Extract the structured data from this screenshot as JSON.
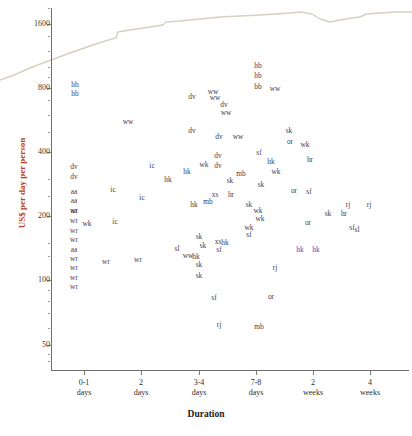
{
  "chart_data": {
    "type": "scatter",
    "title": "",
    "xlabel": "Duration",
    "ylabel": "US$ per day per person",
    "yscale": "log",
    "ylim": [
      38,
      1900
    ],
    "grid": false,
    "legend": "none",
    "ylabel_color": "#b0432a",
    "point_color": "#3c3c52",
    "highlight_color": "#2f4fa8",
    "curve_color": "#d9cfbe",
    "ytick_labels": [
      "1600",
      "800",
      "400",
      "200",
      "100",
      "50"
    ],
    "ytick_values": [
      1600,
      800,
      400,
      200,
      100,
      50
    ],
    "xtick_labels": [
      {
        "line1": "0-1",
        "line2": "days"
      },
      {
        "line1": "2",
        "line2": "days"
      },
      {
        "line1": "3-4",
        "line2": "days"
      },
      {
        "line1": "7-8",
        "line2": "days"
      },
      {
        "line1": "2",
        "line2": "weeks"
      },
      {
        "line1": "4",
        "line2": "weeks"
      }
    ],
    "xtick_positions_px": [
      84,
      141,
      199,
      256,
      313,
      370
    ],
    "points": [
      {
        "label": "hb",
        "x": 75,
        "y": 85,
        "color": "normal"
      },
      {
        "label": "hb",
        "x": 75,
        "y": 94,
        "color": "normal"
      },
      {
        "label": "hb",
        "x": 258,
        "y": 66,
        "color": "normal"
      },
      {
        "label": "hb",
        "x": 258,
        "y": 76,
        "color": "normal"
      },
      {
        "label": "bb",
        "x": 258,
        "y": 87,
        "color": "normal"
      },
      {
        "label": "ww",
        "x": 213,
        "y": 92,
        "color": "normal"
      },
      {
        "label": "ww",
        "x": 275,
        "y": 89,
        "color": "normal"
      },
      {
        "label": "ww",
        "x": 128,
        "y": 122,
        "color": "normal"
      },
      {
        "label": "ww",
        "x": 226,
        "y": 113,
        "color": "normal"
      },
      {
        "label": "ww",
        "x": 238,
        "y": 137,
        "color": "normal"
      },
      {
        "label": "ww",
        "x": 215,
        "y": 98,
        "color": "normal"
      },
      {
        "label": "dv",
        "x": 192,
        "y": 97,
        "color": "normal"
      },
      {
        "label": "dv",
        "x": 224,
        "y": 105,
        "color": "normal"
      },
      {
        "label": "dv",
        "x": 192,
        "y": 131,
        "color": "normal"
      },
      {
        "label": "dv",
        "x": 219,
        "y": 137,
        "color": "normal"
      },
      {
        "label": "dv",
        "x": 74,
        "y": 167,
        "color": "normal"
      },
      {
        "label": "dv",
        "x": 74,
        "y": 177,
        "color": "normal"
      },
      {
        "label": "dv",
        "x": 218,
        "y": 156,
        "color": "normal"
      },
      {
        "label": "dv",
        "x": 218,
        "y": 166,
        "color": "normal"
      },
      {
        "label": "ic",
        "x": 152,
        "y": 166,
        "color": "normal"
      },
      {
        "label": "ic",
        "x": 113,
        "y": 190,
        "color": "normal"
      },
      {
        "label": "ic",
        "x": 142,
        "y": 198,
        "color": "normal"
      },
      {
        "label": "ic",
        "x": 115,
        "y": 222,
        "color": "normal"
      },
      {
        "label": "hk",
        "x": 168,
        "y": 180,
        "color": "normal"
      },
      {
        "label": "hk",
        "x": 187,
        "y": 172,
        "color": "normal"
      },
      {
        "label": "hk",
        "x": 194,
        "y": 205,
        "color": "normal"
      },
      {
        "label": "hk",
        "x": 271,
        "y": 162,
        "color": "normal"
      },
      {
        "label": "hk",
        "x": 196,
        "y": 257,
        "color": "normal"
      },
      {
        "label": "hk",
        "x": 225,
        "y": 243,
        "color": "normal"
      },
      {
        "label": "wk",
        "x": 204,
        "y": 165,
        "color": "normal"
      },
      {
        "label": "wk",
        "x": 276,
        "y": 172,
        "color": "normal"
      },
      {
        "label": "wk",
        "x": 87,
        "y": 224,
        "color": "normal"
      },
      {
        "label": "wk",
        "x": 305,
        "y": 145,
        "color": "normal"
      },
      {
        "label": "wk",
        "x": 258,
        "y": 211,
        "color": "normal"
      },
      {
        "label": "wk",
        "x": 260,
        "y": 219,
        "color": "normal"
      },
      {
        "label": "wk",
        "x": 249,
        "y": 228,
        "color": "normal"
      },
      {
        "label": "xs",
        "x": 215,
        "y": 195,
        "color": "normal"
      },
      {
        "label": "xs",
        "x": 218,
        "y": 242,
        "color": "normal"
      },
      {
        "label": "hr",
        "x": 231,
        "y": 195,
        "color": "normal"
      },
      {
        "label": "hr",
        "x": 310,
        "y": 160,
        "color": "normal"
      },
      {
        "label": "hr",
        "x": 344,
        "y": 214,
        "color": "normal"
      },
      {
        "label": "mb",
        "x": 208,
        "y": 202,
        "color": "normal"
      },
      {
        "label": "mb",
        "x": 241,
        "y": 174,
        "color": "normal"
      },
      {
        "label": "mb",
        "x": 259,
        "y": 327,
        "color": "normal"
      },
      {
        "label": "sf",
        "x": 259,
        "y": 153,
        "color": "normal"
      },
      {
        "label": "sf",
        "x": 309,
        "y": 192,
        "color": "normal"
      },
      {
        "label": "sf",
        "x": 219,
        "y": 250,
        "color": "normal"
      },
      {
        "label": "sf",
        "x": 249,
        "y": 235,
        "color": "normal"
      },
      {
        "label": "sf",
        "x": 214,
        "y": 298,
        "color": "normal"
      },
      {
        "label": "sf",
        "x": 352,
        "y": 228,
        "color": "normal"
      },
      {
        "label": "sk",
        "x": 289,
        "y": 131,
        "color": "normal"
      },
      {
        "label": "sk",
        "x": 261,
        "y": 185,
        "color": "normal"
      },
      {
        "label": "sk",
        "x": 230,
        "y": 181,
        "color": "normal"
      },
      {
        "label": "sk",
        "x": 249,
        "y": 205,
        "color": "normal"
      },
      {
        "label": "sk",
        "x": 328,
        "y": 214,
        "color": "normal"
      },
      {
        "label": "sk",
        "x": 199,
        "y": 237,
        "color": "normal"
      },
      {
        "label": "sk",
        "x": 199,
        "y": 265,
        "color": "normal"
      },
      {
        "label": "sk",
        "x": 199,
        "y": 276,
        "color": "normal"
      },
      {
        "label": "sk",
        "x": 203,
        "y": 246,
        "color": "normal"
      },
      {
        "label": "or",
        "x": 290,
        "y": 142,
        "color": "normal"
      },
      {
        "label": "or",
        "x": 294,
        "y": 191,
        "color": "normal"
      },
      {
        "label": "or",
        "x": 308,
        "y": 223,
        "color": "normal"
      },
      {
        "label": "or",
        "x": 271,
        "y": 297,
        "color": "normal"
      },
      {
        "label": "rj",
        "x": 348,
        "y": 205,
        "color": "normal"
      },
      {
        "label": "rj",
        "x": 369,
        "y": 205,
        "color": "normal"
      },
      {
        "label": "rj",
        "x": 275,
        "y": 268,
        "color": "normal"
      },
      {
        "label": "rj",
        "x": 219,
        "y": 325,
        "color": "normal"
      },
      {
        "label": "sl",
        "x": 357,
        "y": 230,
        "color": "normal"
      },
      {
        "label": "sl",
        "x": 177,
        "y": 249,
        "color": "normal"
      },
      {
        "label": "ww",
        "x": 188,
        "y": 256,
        "color": "normal"
      },
      {
        "label": "wr",
        "x": 74,
        "y": 211,
        "color": "normal"
      },
      {
        "label": "wr",
        "x": 74,
        "y": 221,
        "color": "normal"
      },
      {
        "label": "wr",
        "x": 74,
        "y": 231,
        "color": "normal"
      },
      {
        "label": "wr",
        "x": 74,
        "y": 240,
        "color": "normal"
      },
      {
        "label": "wr",
        "x": 74,
        "y": 259,
        "color": "normal"
      },
      {
        "label": "wr",
        "x": 74,
        "y": 268,
        "color": "normal"
      },
      {
        "label": "wr",
        "x": 74,
        "y": 278,
        "color": "normal"
      },
      {
        "label": "wr",
        "x": 74,
        "y": 287,
        "color": "normal"
      },
      {
        "label": "wr",
        "x": 106,
        "y": 262,
        "color": "normal"
      },
      {
        "label": "wr",
        "x": 138,
        "y": 260,
        "color": "normal"
      },
      {
        "label": "aa",
        "x": 74,
        "y": 192,
        "color": "normal"
      },
      {
        "label": "aa",
        "x": 74,
        "y": 201,
        "color": "normal"
      },
      {
        "label": "aa",
        "x": 74,
        "y": 211,
        "color": "normal"
      },
      {
        "label": "aa",
        "x": 74,
        "y": 250,
        "color": "normal"
      },
      {
        "label": "hk",
        "x": 300,
        "y": 250,
        "color": "highlight"
      },
      {
        "label": "hk",
        "x": 316,
        "y": 250,
        "color": "highlight"
      }
    ],
    "curve": {
      "name": "upper-envelope",
      "color": "#d9cfbe",
      "points_px": [
        [
          0,
          80
        ],
        [
          14,
          75
        ],
        [
          30,
          68
        ],
        [
          51,
          60
        ],
        [
          70,
          53
        ],
        [
          90,
          46
        ],
        [
          105,
          41
        ],
        [
          112,
          39
        ],
        [
          116,
          38
        ],
        [
          118,
          32
        ],
        [
          130,
          30
        ],
        [
          150,
          27
        ],
        [
          163,
          25
        ],
        [
          166,
          22
        ],
        [
          180,
          21
        ],
        [
          200,
          19
        ],
        [
          220,
          17
        ],
        [
          240,
          16
        ],
        [
          260,
          15
        ],
        [
          275,
          14
        ],
        [
          290,
          13
        ],
        [
          300,
          12
        ],
        [
          312,
          14
        ],
        [
          320,
          19
        ],
        [
          330,
          22
        ],
        [
          340,
          20
        ],
        [
          352,
          18
        ],
        [
          360,
          17
        ],
        [
          366,
          14
        ],
        [
          380,
          13
        ],
        [
          395,
          12
        ],
        [
          412,
          12
        ]
      ]
    }
  }
}
